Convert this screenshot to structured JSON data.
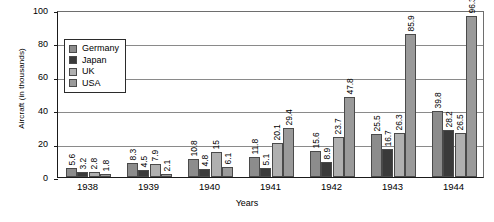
{
  "chart_data": {
    "type": "bar",
    "title": "",
    "xlabel": "Years",
    "ylabel": "Aircraft (in thousands)",
    "categories": [
      "1938",
      "1939",
      "1940",
      "1941",
      "1942",
      "1943",
      "1944"
    ],
    "ylim": [
      0,
      100
    ],
    "yticks": [
      0,
      20,
      40,
      60,
      80,
      100
    ],
    "ytick_labels": [
      "0",
      "20",
      "40",
      "60",
      "80",
      "100"
    ],
    "grid": true,
    "legend_position": "upper-left-inside",
    "series": [
      {
        "name": "Germany",
        "color": "#8c8c8c",
        "values": [
          5.6,
          8.3,
          10.8,
          11.8,
          15.6,
          25.5,
          39.8
        ],
        "labels": [
          "5.6",
          "8.3",
          "10.8",
          "11.8",
          "15.6",
          "25.5",
          "39.8"
        ]
      },
      {
        "name": "Japan",
        "color": "#3a3a3a",
        "values": [
          3.2,
          4.5,
          4.8,
          5.1,
          8.9,
          16.7,
          28.2
        ],
        "labels": [
          "3.2",
          "4.5",
          "4.8",
          "5.1",
          "8.9",
          "16.7",
          "28.2"
        ]
      },
      {
        "name": "UK",
        "color": "#b0b0b0",
        "values": [
          2.8,
          7.9,
          15,
          20.1,
          23.7,
          26.3,
          26.5
        ],
        "labels": [
          "2.8",
          "7.9",
          "15",
          "20.1",
          "23.7",
          "26.3",
          "26.5"
        ]
      },
      {
        "name": "USA",
        "color": "#9a9a9a",
        "values": [
          1.8,
          2.1,
          6.1,
          29.4,
          47.8,
          85.9,
          96.3
        ],
        "labels": [
          "1.8",
          "2.1",
          "6.1",
          "29.4",
          "47.8",
          "85.9",
          "96.3"
        ]
      }
    ]
  },
  "legend": {
    "items": [
      {
        "label": "Germany"
      },
      {
        "label": "Japan"
      },
      {
        "label": "UK"
      },
      {
        "label": "USA"
      }
    ]
  }
}
